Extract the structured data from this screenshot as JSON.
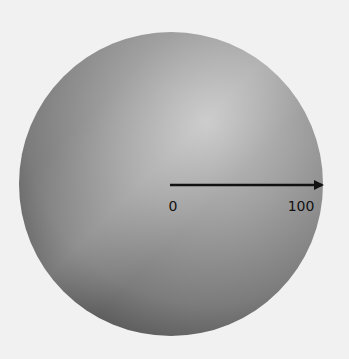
{
  "diagram": {
    "shape": "sphere",
    "background_color": "#f1f1f1",
    "sphere_colors": {
      "light": "#bdbdbd",
      "mid": "#8f8f8f",
      "dark": "#4e4e4e"
    },
    "radius_arrow": {
      "start_label": "0",
      "end_label": "100"
    }
  }
}
